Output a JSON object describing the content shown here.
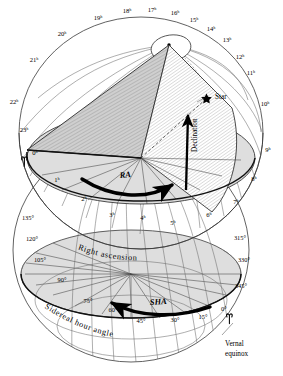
{
  "figure": {
    "type": "astronomical-diagram"
  },
  "chart_data": {
    "type": "diagram",
    "upper_sphere": {
      "scale_name": "Right ascension",
      "unit": "hours",
      "direction": "eastward from vernal equinox",
      "tick_labels": [
        "0ʰ",
        "1ʰ",
        "2ʰ",
        "3ʰ",
        "4ʰ",
        "5ʰ",
        "6ʰ",
        "7ʰ",
        "8ʰ",
        "9ʰ",
        "10ʰ",
        "11ʰ",
        "12ʰ",
        "13ʰ",
        "14ʰ",
        "15ʰ",
        "16ʰ",
        "17ʰ",
        "18ʰ",
        "19ʰ",
        "20ʰ",
        "21ʰ",
        "22ʰ",
        "23ʰ"
      ]
    },
    "lower_sphere": {
      "scale_name": "Sidereal hour angle",
      "unit": "degrees",
      "direction": "westward from vernal equinox",
      "tick_labels": [
        "0°",
        "15°",
        "30°",
        "45°",
        "60°",
        "75°",
        "90°",
        "105°",
        "120°",
        "135°",
        "315°",
        "330°",
        "345°"
      ]
    },
    "annotations": [
      "Star",
      "Declination",
      "RA",
      "SHA",
      "Right ascension",
      "Sidereal hour angle",
      "Vernal equinox"
    ]
  },
  "top_ticks": [
    {
      "label": "22ʰ",
      "x": 14,
      "y": 104
    },
    {
      "label": "21ʰ",
      "x": 34,
      "y": 62
    },
    {
      "label": "20ʰ",
      "x": 62,
      "y": 36
    },
    {
      "label": "19ʰ",
      "x": 98,
      "y": 20
    },
    {
      "label": "18ʰ",
      "x": 127,
      "y": 13
    },
    {
      "label": "17ʰ",
      "x": 152,
      "y": 12
    },
    {
      "label": "16ʰ",
      "x": 175,
      "y": 15
    },
    {
      "label": "15ʰ",
      "x": 194,
      "y": 22
    },
    {
      "label": "14ʰ",
      "x": 211,
      "y": 31
    },
    {
      "label": "13ʰ",
      "x": 227,
      "y": 42
    },
    {
      "label": "12ʰ",
      "x": 240,
      "y": 59
    },
    {
      "label": "11ʰ",
      "x": 251,
      "y": 75
    },
    {
      "label": "10ʰ",
      "x": 265,
      "y": 106
    },
    {
      "label": "9ʰ",
      "x": 268,
      "y": 152
    },
    {
      "label": "8ʰ",
      "x": 254,
      "y": 181
    },
    {
      "label": "7ʰ",
      "x": 236,
      "y": 204
    },
    {
      "label": "6ʰ",
      "x": 209,
      "y": 217
    },
    {
      "label": "5ʰ",
      "x": 173,
      "y": 225
    },
    {
      "label": "4ʰ",
      "x": 143,
      "y": 220
    },
    {
      "label": "3ʰ",
      "x": 112,
      "y": 217
    },
    {
      "label": "2ʰ",
      "x": 84,
      "y": 201
    },
    {
      "label": "1ʰ",
      "x": 57,
      "y": 182
    },
    {
      "label": "0ʰ",
      "x": 35,
      "y": 155
    },
    {
      "label": "23ʰ",
      "x": 24,
      "y": 132
    }
  ],
  "bottom_ticks": [
    {
      "label": "135°",
      "x": 28,
      "y": 220
    },
    {
      "label": "120°",
      "x": 32,
      "y": 241
    },
    {
      "label": "105°",
      "x": 40,
      "y": 262
    },
    {
      "label": "90°",
      "x": 62,
      "y": 282
    },
    {
      "label": "75°",
      "x": 88,
      "y": 303
    },
    {
      "label": "60°",
      "x": 113,
      "y": 312
    },
    {
      "label": "45°",
      "x": 141,
      "y": 323
    },
    {
      "label": "30°",
      "x": 175,
      "y": 322
    },
    {
      "label": "15°",
      "x": 203,
      "y": 319
    },
    {
      "label": "0°",
      "x": 224,
      "y": 311
    },
    {
      "label": "345°",
      "x": 241,
      "y": 288
    },
    {
      "label": "330°",
      "x": 244,
      "y": 262
    },
    {
      "label": "315°",
      "x": 240,
      "y": 240
    }
  ],
  "labels": {
    "star": "Star",
    "declination": "Declination",
    "ra_arrow": "RA",
    "sha_arrow": "SHA",
    "right_ascension": "Right ascension",
    "sidereal_hour_angle": "Sidereal hour angle",
    "vernal_equinox_line1": "Vernal",
    "vernal_equinox_line2": "equinox"
  },
  "colors": {
    "background": "#ffffff",
    "shade_gray": "#dedede",
    "shade_gray_dark": "#cfcfcf",
    "grid_line": "#6d6d6d",
    "outline": "#3a3a3a",
    "ink": "#000000"
  }
}
